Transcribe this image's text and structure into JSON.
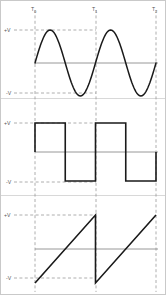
{
  "figure": {
    "title": "",
    "width": 166,
    "height": 295,
    "background": "#ffffff",
    "frame_color": "#c9c9c9",
    "trace_color": "#1a1a1a",
    "guide_color": "#9a9a9a",
    "zero_line_color": "#8d8d8d",
    "label_color": "#555555"
  },
  "time_axis": {
    "ticks": [
      {
        "id": "t0",
        "label": "T",
        "subscript": "0",
        "x": 35
      },
      {
        "id": "t1",
        "label": "T",
        "subscript": "1",
        "x": 96
      },
      {
        "id": "t2",
        "label": "T",
        "subscript": "2",
        "x": 156
      }
    ]
  },
  "panels": [
    {
      "id": "sine",
      "name": "sine-waveform",
      "top": 14,
      "bottom": 97,
      "zero_y": 63,
      "plus_v": {
        "label": "+V",
        "y": 30
      },
      "minus_v": {
        "label": "-V",
        "y": 93
      },
      "amplitude": 33
    },
    {
      "id": "square",
      "name": "square-waveform",
      "top": 100,
      "bottom": 189,
      "zero_y": 152,
      "plus_v": {
        "label": "+V",
        "y": 123
      },
      "minus_v": {
        "label": "-V",
        "y": 182
      },
      "amplitude": 29
    },
    {
      "id": "sawtooth",
      "name": "sawtooth-waveform",
      "top": 198,
      "bottom": 288,
      "zero_y": 249,
      "plus_v": {
        "label": "+V",
        "y": 215
      },
      "minus_v": {
        "label": "-V",
        "y": 278
      },
      "amplitude": 34
    }
  ],
  "chart_data": {
    "type": "line",
    "xlabel": "",
    "ylabel": "",
    "grid": true,
    "legend": "none",
    "xlim": [
      0,
      2
    ],
    "ylim": [
      -1,
      1
    ],
    "x_tick_labels": [
      "T0",
      "T1",
      "T2"
    ],
    "x_tick_values": [
      0,
      1,
      2
    ],
    "y_tick_labels": [
      "+V",
      "-V"
    ],
    "y_tick_values": [
      1,
      -1
    ],
    "series": [
      {
        "name": "Sine",
        "type": "line",
        "shape": "sine",
        "period": 1,
        "start": 0,
        "end": 2,
        "amplitude": 1,
        "x": [
          0,
          0.125,
          0.25,
          0.375,
          0.5,
          0.625,
          0.75,
          0.875,
          1.0,
          1.125,
          1.25,
          1.375,
          1.5,
          1.625,
          1.75,
          1.875,
          2.0
        ],
        "values": [
          0,
          0.707,
          1,
          0.707,
          0,
          -0.707,
          -1,
          -0.707,
          0,
          0.707,
          1,
          0.707,
          0,
          -0.707,
          -1,
          -0.707,
          0
        ]
      },
      {
        "name": "Square",
        "type": "step",
        "shape": "square",
        "period": 1,
        "start": 0,
        "end": 2,
        "amplitude": 1,
        "x": [
          0,
          0.5,
          0.5,
          1.0,
          1.0,
          1.5,
          1.5,
          2.0
        ],
        "values": [
          1,
          1,
          -1,
          -1,
          1,
          1,
          -1,
          -1
        ]
      },
      {
        "name": "Sawtooth",
        "type": "line",
        "shape": "sawtooth",
        "period": 1,
        "start": 0,
        "end": 2,
        "amplitude": 1,
        "x": [
          0,
          1.0,
          1.0,
          2.0
        ],
        "values": [
          -1,
          1,
          -1,
          1
        ]
      }
    ],
    "annotations": [
      {
        "text": "T0",
        "x": 0,
        "position": "top"
      },
      {
        "text": "T1",
        "x": 1,
        "position": "top"
      },
      {
        "text": "T2",
        "x": 2,
        "position": "top"
      }
    ]
  }
}
